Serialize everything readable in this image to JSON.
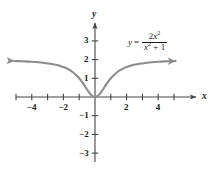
{
  "chart_data": {
    "type": "line",
    "title": "",
    "subtitle": "",
    "xlabel": "x",
    "ylabel": "y",
    "xlim": [
      -5.3,
      5.3
    ],
    "ylim": [
      -3.6,
      3.8
    ],
    "grid": false,
    "legend_position": "inside-upper-right",
    "annotations": [
      {
        "name": "curve-equation",
        "lhs": "y",
        "equals": "=",
        "numerator_coefficient": "2",
        "numerator_variable": "x",
        "numerator_exponent": "2",
        "denominator_variable": "x",
        "denominator_exponent": "2",
        "denominator_tail": "+ 1",
        "text": "y = 2x^2 / (x^2 + 1)"
      }
    ],
    "x_tick_values": [
      -5,
      -4,
      -3,
      -2,
      -1,
      1,
      2,
      3,
      4,
      5
    ],
    "x_tick_labels": [
      "",
      "-4",
      "",
      "-2",
      "",
      "",
      "2",
      "",
      "4",
      ""
    ],
    "x_labeled_ticks": [
      {
        "value": -4,
        "label": "−4"
      },
      {
        "value": -2,
        "label": "−2"
      },
      {
        "value": 2,
        "label": "2"
      },
      {
        "value": 4,
        "label": "4"
      }
    ],
    "y_tick_values": [
      -3,
      -2,
      -1,
      1,
      2,
      3
    ],
    "y_labeled_ticks": [
      {
        "value": 3,
        "label": "3"
      },
      {
        "value": 2,
        "label": "2"
      },
      {
        "value": 1,
        "label": "1"
      },
      {
        "value": -1,
        "label": "−1"
      },
      {
        "value": -2,
        "label": "−2"
      },
      {
        "value": -3,
        "label": "−3"
      }
    ],
    "series": [
      {
        "name": "y = 2x^2/(x^2+1)",
        "color": "#8c8c8c",
        "arrow_start": true,
        "arrow_end": true,
        "horizontal_asymptote": 2,
        "points": [
          {
            "x": -5.1,
            "y": 1.926
          },
          {
            "x": -4.8,
            "y": 1.917
          },
          {
            "x": -4.4,
            "y": 1.903
          },
          {
            "x": -4.0,
            "y": 1.882
          },
          {
            "x": -3.6,
            "y": 1.857
          },
          {
            "x": -3.2,
            "y": 1.822
          },
          {
            "x": -2.8,
            "y": 1.775
          },
          {
            "x": -2.4,
            "y": 1.711
          },
          {
            "x": -2.0,
            "y": 1.6
          },
          {
            "x": -1.8,
            "y": 1.528
          },
          {
            "x": -1.6,
            "y": 1.438
          },
          {
            "x": -1.4,
            "y": 1.325
          },
          {
            "x": -1.2,
            "y": 1.18
          },
          {
            "x": -1.0,
            "y": 1.0
          },
          {
            "x": -0.8,
            "y": 0.78
          },
          {
            "x": -0.6,
            "y": 0.529
          },
          {
            "x": -0.4,
            "y": 0.276
          },
          {
            "x": -0.2,
            "y": 0.077
          },
          {
            "x": 0.0,
            "y": 0.0
          },
          {
            "x": 0.2,
            "y": 0.077
          },
          {
            "x": 0.4,
            "y": 0.276
          },
          {
            "x": 0.6,
            "y": 0.529
          },
          {
            "x": 0.8,
            "y": 0.78
          },
          {
            "x": 1.0,
            "y": 1.0
          },
          {
            "x": 1.2,
            "y": 1.18
          },
          {
            "x": 1.4,
            "y": 1.325
          },
          {
            "x": 1.6,
            "y": 1.438
          },
          {
            "x": 1.8,
            "y": 1.528
          },
          {
            "x": 2.0,
            "y": 1.6
          },
          {
            "x": 2.4,
            "y": 1.711
          },
          {
            "x": 2.8,
            "y": 1.775
          },
          {
            "x": 3.2,
            "y": 1.822
          },
          {
            "x": 3.6,
            "y": 1.857
          },
          {
            "x": 4.0,
            "y": 1.882
          },
          {
            "x": 4.4,
            "y": 1.903
          },
          {
            "x": 4.8,
            "y": 1.917
          },
          {
            "x": 5.1,
            "y": 1.926
          }
        ]
      }
    ],
    "colors": {
      "curve": "#8c8c8c",
      "axis": "#444444",
      "text": "#1a1a1a",
      "background": "#ffffff"
    }
  }
}
